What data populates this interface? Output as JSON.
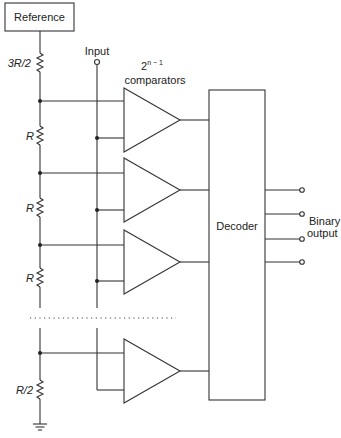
{
  "diagram": {
    "reference_label": "Reference",
    "input_label": "Input",
    "comparators_label_base": "2",
    "comparators_label_exp": "n − 1",
    "comparators_label": "comparators",
    "decoder_label": "Decoder",
    "output_label_line1": "Binary",
    "output_label_line2": "output",
    "resistors": [
      {
        "label": "3R/2"
      },
      {
        "label": "R"
      },
      {
        "label": "R"
      },
      {
        "label": "R"
      },
      {
        "label": "R/2"
      }
    ],
    "comparator_count_drawn": 4,
    "binary_output_count": 4,
    "ground_symbol": "ground-icon",
    "ellipsis": "dotted-continuation"
  }
}
